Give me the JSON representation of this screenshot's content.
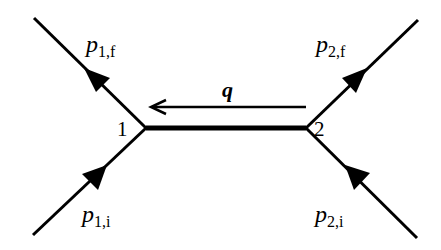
{
  "diagram": {
    "type": "feynman-diagram",
    "line_color": "#000000",
    "background": "#ffffff",
    "vertices": [
      {
        "id": "1",
        "label": "1"
      },
      {
        "id": "2",
        "label": "2"
      }
    ],
    "propagator": {
      "label": "q",
      "direction": "from vertex 2 to vertex 1"
    },
    "external_lines": [
      {
        "name": "p1f",
        "label_main": "p",
        "label_sub": "1,f",
        "vertex": "1",
        "direction": "outgoing"
      },
      {
        "name": "p1i",
        "label_main": "p",
        "label_sub": "1,i",
        "vertex": "1",
        "direction": "incoming"
      },
      {
        "name": "p2f",
        "label_main": "p",
        "label_sub": "2,f",
        "vertex": "2",
        "direction": "outgoing"
      },
      {
        "name": "p2i",
        "label_main": "p",
        "label_sub": "2,i",
        "vertex": "2",
        "direction": "incoming"
      }
    ]
  }
}
